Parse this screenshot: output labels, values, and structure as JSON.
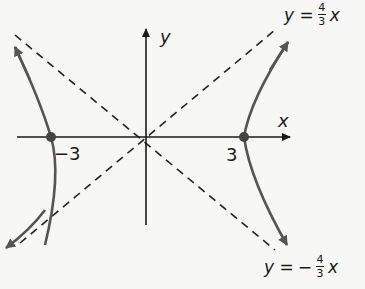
{
  "diagram": {
    "colors": {
      "curve": "#555555",
      "axis": "#1a1a1a",
      "asymptote": "#222222",
      "vertex": "#444444",
      "background": "#f7f7f5"
    },
    "axes": {
      "x_label": "x",
      "y_label": "y"
    },
    "vertices": [
      {
        "label": "−3",
        "x": -3,
        "y": 0
      },
      {
        "label": "3",
        "x": 3,
        "y": 0
      }
    ],
    "asymptotes": [
      {
        "label_lhs": "y =",
        "sign": "",
        "numerator": "4",
        "denominator": "3",
        "var": "x"
      },
      {
        "label_lhs": "y =",
        "sign": "−",
        "numerator": "4",
        "denominator": "3",
        "var": "x"
      }
    ]
  }
}
